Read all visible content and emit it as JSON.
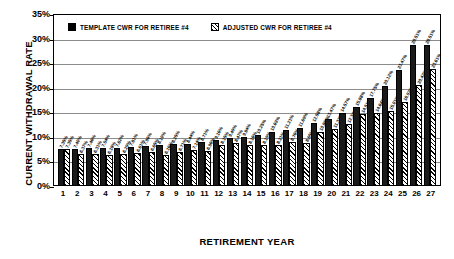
{
  "chart_data": {
    "type": "bar",
    "title": "",
    "xlabel": "RETIREMENT YEAR",
    "ylabel": "CURRENT WITHDRAWAL RATE",
    "ylim": [
      0,
      35
    ],
    "ytick_labels": [
      "0%",
      "5%",
      "10%",
      "15%",
      "20%",
      "25%",
      "30%",
      "35%"
    ],
    "ytick_values": [
      0,
      5,
      10,
      15,
      20,
      25,
      30,
      35
    ],
    "grid": true,
    "legend_position": "top-left",
    "categories": [
      "1",
      "2",
      "3",
      "4",
      "5",
      "6",
      "7",
      "8",
      "9",
      "10",
      "11",
      "12",
      "13",
      "14",
      "15",
      "16",
      "17",
      "18",
      "19",
      "20",
      "21",
      "22",
      "23",
      "24",
      "25",
      "26",
      "27"
    ],
    "series": [
      {
        "name": "TEMPLATE CWR FOR RETIREE #4",
        "fill": "solid-black",
        "color": "#1a1a1a",
        "values": [
          7.35,
          7.4,
          7.46,
          7.54,
          7.62,
          7.81,
          7.96,
          8.1,
          8.25,
          8.44,
          8.71,
          9.16,
          9.49,
          9.84,
          10.25,
          10.69,
          11.21,
          11.69,
          12.58,
          13.47,
          14.57,
          15.88,
          17.75,
          20.12,
          23.47,
          28.51,
          28.51
        ],
        "labels": [
          "7.35%",
          "7.40%",
          "7.46%",
          "7.54%",
          "7.62%",
          "7.81%",
          "7.96%",
          "8.10%",
          "8.25%",
          "8.44%",
          "8.71%",
          "9.16%",
          "9.49%",
          "9.84%",
          "10.25%",
          "10.69%",
          "11.21%",
          "11.69%",
          "12.58%",
          "13.47%",
          "14.57%",
          "15.88%",
          "17.75%",
          "20.12%",
          "23.47%",
          "28.51%",
          "28.51%"
        ]
      },
      {
        "name": "ADJUSTED CWR FOR RETIREE #4",
        "fill": "diagonal-hatch",
        "color": "#ffffff",
        "values": [
          7.35,
          6.37,
          6.31,
          6.18,
          6.29,
          6.61,
          6.65,
          6.16,
          6.71,
          7.14,
          6.96,
          8.15,
          8.47,
          8.16,
          8.19,
          8.21,
          8.76,
          8.65,
          10.86,
          11.33,
          12.34,
          14.51,
          14.64,
          15.01,
          16.92,
          20.42,
          23.61
        ],
        "labels": [
          "7.35%",
          "6.37%",
          "6.31%",
          "6.18%",
          "6.29%",
          "6.61%",
          "6.65%",
          "6.16%",
          "6.71%",
          "7.14%",
          "6.96%",
          "8.15%",
          "8.47%",
          "8.16%",
          "8.19%",
          "8.21%",
          "8.76%",
          "8.65%",
          "10.86%",
          "11.33%",
          "12.34%",
          "14.51%",
          "14.64%",
          "15.01%",
          "16.92%",
          "20.42%",
          "23.61%"
        ]
      }
    ]
  },
  "legend": {
    "entries": [
      {
        "label": "TEMPLATE CWR FOR RETIREE #4"
      },
      {
        "label": "ADJUSTED CWR FOR RETIREE #4"
      }
    ]
  }
}
